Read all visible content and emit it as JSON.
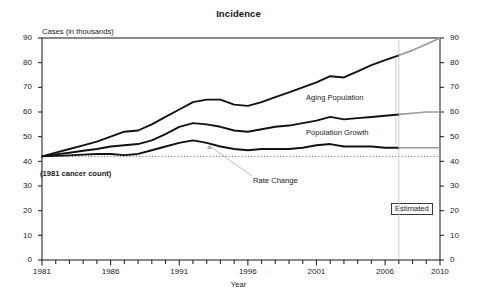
{
  "chart_data": {
    "type": "line",
    "title": "Incidence",
    "xlabel": "Year",
    "ylabel": "Cases (in thousands)",
    "ylim": [
      0,
      90
    ],
    "xlim": [
      1981,
      2010
    ],
    "ytick_labels": [
      "90",
      "80",
      "70",
      "60",
      "50",
      "40",
      "30",
      "20",
      "10",
      "0"
    ],
    "ytick_values": [
      90,
      80,
      70,
      60,
      50,
      40,
      30,
      20,
      10,
      0
    ],
    "ytick_labels_right": [
      "90",
      "80",
      "70",
      "60",
      "50",
      "40",
      "30",
      "20",
      "10",
      "0"
    ],
    "xtick_labels": [
      "1981",
      "1986",
      "1991",
      "1996",
      "2001",
      "2006",
      "2010"
    ],
    "xtick_values": [
      1981,
      1986,
      1991,
      1996,
      2001,
      2006,
      2010
    ],
    "grid": false,
    "legend_position": "inline-labels",
    "axis_color": "#2b2b2b",
    "line_color": "#121212",
    "estimated_color": "#9a9a9a",
    "baseline_value": 42,
    "baseline_style": "dotted",
    "forecast_start_year": 2007,
    "x": [
      1981,
      1982,
      1983,
      1984,
      1985,
      1986,
      1987,
      1988,
      1989,
      1990,
      1991,
      1992,
      1993,
      1994,
      1995,
      1996,
      1997,
      1998,
      1999,
      2000,
      2001,
      2002,
      2003,
      2004,
      2005,
      2006,
      2007,
      2008,
      2009,
      2010
    ],
    "series": [
      {
        "name": "Aging Population",
        "label": "Aging Population",
        "values": [
          42,
          43.5,
          45,
          46.5,
          48,
          50,
          52,
          52.5,
          55,
          58,
          61,
          64,
          65,
          65,
          63,
          62.5,
          64,
          66,
          68,
          70,
          72,
          74.5,
          74,
          76.5,
          79,
          81,
          83,
          85,
          87.5,
          90
        ]
      },
      {
        "name": "Population Growth",
        "label": "Population Growth",
        "values": [
          42,
          42.8,
          43.5,
          44.3,
          45,
          46,
          46.5,
          47,
          48.5,
          51,
          54,
          55.5,
          55,
          54,
          52.5,
          52,
          53,
          54,
          54.5,
          55.5,
          56.5,
          58,
          57,
          57.5,
          58,
          58.5,
          59,
          59.5,
          60,
          60
        ]
      },
      {
        "name": "Rate Change",
        "label": "Rate Change",
        "values": [
          42,
          42.2,
          42.4,
          42.7,
          43,
          43,
          42.5,
          43,
          44.5,
          46,
          47.5,
          48.5,
          47.5,
          46,
          45,
          44.5,
          45,
          45,
          45,
          45.5,
          46.5,
          47,
          46,
          46,
          46,
          45.5,
          45.5,
          45.5,
          45.5,
          45.5
        ]
      }
    ],
    "annotations": [
      {
        "text": "(1981 cancer count)",
        "bold": true
      },
      {
        "text": "Estimated",
        "boxed": true
      }
    ]
  }
}
